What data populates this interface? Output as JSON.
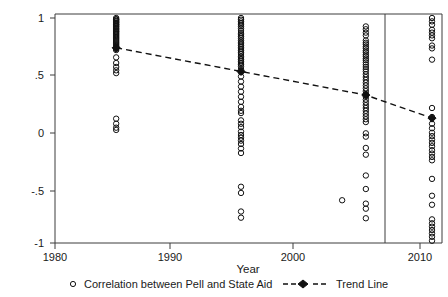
{
  "chart_data": {
    "type": "scatter",
    "title": "",
    "xlabel": "Year",
    "ylabel": "",
    "xlim": [
      1980,
      2011
    ],
    "ylim": [
      -1,
      1
    ],
    "grid": false,
    "legend_position": "bottom",
    "x_ticks": [
      1980,
      1990,
      2000,
      2010
    ],
    "x_tick_labels": [
      "1980",
      "1990",
      "2000",
      "2010"
    ],
    "y_ticks": [
      1,
      0.5,
      0,
      -0.5,
      -1
    ],
    "y_tick_labels": [
      "1",
      ".5",
      "0",
      "-.5",
      "-1"
    ],
    "annotations": [
      {
        "name": "reference-vline",
        "type": "vline",
        "x": 2008.4,
        "label": ""
      }
    ],
    "series": [
      {
        "name": "Correlation between Pell and State Aid",
        "marker": "open-circle",
        "color": "#111111",
        "points": [
          {
            "x": 1984.9,
            "y": 1.0
          },
          {
            "x": 1984.9,
            "y": 0.99
          },
          {
            "x": 1984.9,
            "y": 0.985
          },
          {
            "x": 1984.9,
            "y": 0.975
          },
          {
            "x": 1984.9,
            "y": 0.97
          },
          {
            "x": 1984.9,
            "y": 0.96
          },
          {
            "x": 1984.9,
            "y": 0.955
          },
          {
            "x": 1984.9,
            "y": 0.945
          },
          {
            "x": 1984.9,
            "y": 0.94
          },
          {
            "x": 1984.9,
            "y": 0.93
          },
          {
            "x": 1984.9,
            "y": 0.925
          },
          {
            "x": 1984.9,
            "y": 0.915
          },
          {
            "x": 1984.9,
            "y": 0.905
          },
          {
            "x": 1984.9,
            "y": 0.9
          },
          {
            "x": 1984.9,
            "y": 0.89
          },
          {
            "x": 1984.9,
            "y": 0.88
          },
          {
            "x": 1984.9,
            "y": 0.875
          },
          {
            "x": 1984.9,
            "y": 0.865
          },
          {
            "x": 1984.9,
            "y": 0.855
          },
          {
            "x": 1984.9,
            "y": 0.845
          },
          {
            "x": 1984.9,
            "y": 0.835
          },
          {
            "x": 1984.9,
            "y": 0.825
          },
          {
            "x": 1984.9,
            "y": 0.815
          },
          {
            "x": 1984.9,
            "y": 0.805
          },
          {
            "x": 1984.9,
            "y": 0.795
          },
          {
            "x": 1984.9,
            "y": 0.785
          },
          {
            "x": 1984.9,
            "y": 0.775
          },
          {
            "x": 1984.9,
            "y": 0.765
          },
          {
            "x": 1984.9,
            "y": 0.755
          },
          {
            "x": 1984.9,
            "y": 0.745
          },
          {
            "x": 1984.9,
            "y": 0.735
          },
          {
            "x": 1984.9,
            "y": 0.725
          },
          {
            "x": 1984.9,
            "y": 0.715
          },
          {
            "x": 1984.9,
            "y": 0.65
          },
          {
            "x": 1984.9,
            "y": 0.6
          },
          {
            "x": 1984.9,
            "y": 0.565
          },
          {
            "x": 1984.9,
            "y": 0.535
          },
          {
            "x": 1984.9,
            "y": 0.51
          },
          {
            "x": 1984.9,
            "y": 0.105
          },
          {
            "x": 1984.9,
            "y": 0.06
          },
          {
            "x": 1984.9,
            "y": 0.025
          },
          {
            "x": 1984.9,
            "y": 0.005
          },
          {
            "x": 1994.9,
            "y": 1.0
          },
          {
            "x": 1994.9,
            "y": 0.985
          },
          {
            "x": 1994.9,
            "y": 0.97
          },
          {
            "x": 1994.9,
            "y": 0.955
          },
          {
            "x": 1994.9,
            "y": 0.94
          },
          {
            "x": 1994.9,
            "y": 0.925
          },
          {
            "x": 1994.9,
            "y": 0.905
          },
          {
            "x": 1994.9,
            "y": 0.885
          },
          {
            "x": 1994.9,
            "y": 0.865
          },
          {
            "x": 1994.9,
            "y": 0.85
          },
          {
            "x": 1994.9,
            "y": 0.835
          },
          {
            "x": 1994.9,
            "y": 0.82
          },
          {
            "x": 1994.9,
            "y": 0.8
          },
          {
            "x": 1994.9,
            "y": 0.785
          },
          {
            "x": 1994.9,
            "y": 0.77
          },
          {
            "x": 1994.9,
            "y": 0.755
          },
          {
            "x": 1994.9,
            "y": 0.74
          },
          {
            "x": 1994.9,
            "y": 0.725
          },
          {
            "x": 1994.9,
            "y": 0.71
          },
          {
            "x": 1994.9,
            "y": 0.695
          },
          {
            "x": 1994.9,
            "y": 0.68
          },
          {
            "x": 1994.9,
            "y": 0.66
          },
          {
            "x": 1994.9,
            "y": 0.645
          },
          {
            "x": 1994.9,
            "y": 0.63
          },
          {
            "x": 1994.9,
            "y": 0.615
          },
          {
            "x": 1994.9,
            "y": 0.6
          },
          {
            "x": 1994.9,
            "y": 0.585
          },
          {
            "x": 1994.9,
            "y": 0.57
          },
          {
            "x": 1994.9,
            "y": 0.545
          },
          {
            "x": 1994.9,
            "y": 0.52
          },
          {
            "x": 1994.9,
            "y": 0.48
          },
          {
            "x": 1994.9,
            "y": 0.435
          },
          {
            "x": 1994.9,
            "y": 0.39
          },
          {
            "x": 1994.9,
            "y": 0.345
          },
          {
            "x": 1994.9,
            "y": 0.3
          },
          {
            "x": 1994.9,
            "y": 0.255
          },
          {
            "x": 1994.9,
            "y": 0.21
          },
          {
            "x": 1994.9,
            "y": 0.175
          },
          {
            "x": 1994.9,
            "y": 0.155
          },
          {
            "x": 1994.9,
            "y": 0.09
          },
          {
            "x": 1994.9,
            "y": 0.06
          },
          {
            "x": 1994.9,
            "y": 0.03
          },
          {
            "x": 1994.9,
            "y": -0.01
          },
          {
            "x": 1994.9,
            "y": -0.04
          },
          {
            "x": 1994.9,
            "y": -0.065
          },
          {
            "x": 1994.9,
            "y": -0.09
          },
          {
            "x": 1994.9,
            "y": -0.12
          },
          {
            "x": 1994.9,
            "y": -0.16
          },
          {
            "x": 1994.9,
            "y": -0.2
          },
          {
            "x": 1994.9,
            "y": -0.5
          },
          {
            "x": 1994.9,
            "y": -0.555
          },
          {
            "x": 1994.9,
            "y": -0.72
          },
          {
            "x": 1994.9,
            "y": -0.775
          },
          {
            "x": 2004.9,
            "y": 0.925
          },
          {
            "x": 2004.9,
            "y": 0.9
          },
          {
            "x": 2004.9,
            "y": 0.87
          },
          {
            "x": 2004.9,
            "y": 0.845
          },
          {
            "x": 2004.9,
            "y": 0.8
          },
          {
            "x": 2004.9,
            "y": 0.78
          },
          {
            "x": 2004.9,
            "y": 0.765
          },
          {
            "x": 2004.9,
            "y": 0.745
          },
          {
            "x": 2004.9,
            "y": 0.73
          },
          {
            "x": 2004.9,
            "y": 0.71
          },
          {
            "x": 2004.9,
            "y": 0.695
          },
          {
            "x": 2004.9,
            "y": 0.675
          },
          {
            "x": 2004.9,
            "y": 0.66
          },
          {
            "x": 2004.9,
            "y": 0.64
          },
          {
            "x": 2004.9,
            "y": 0.625
          },
          {
            "x": 2004.9,
            "y": 0.605
          },
          {
            "x": 2004.9,
            "y": 0.585
          },
          {
            "x": 2004.9,
            "y": 0.565
          },
          {
            "x": 2004.9,
            "y": 0.545
          },
          {
            "x": 2004.9,
            "y": 0.525
          },
          {
            "x": 2004.9,
            "y": 0.5
          },
          {
            "x": 2004.9,
            "y": 0.475
          },
          {
            "x": 2004.9,
            "y": 0.45
          },
          {
            "x": 2004.9,
            "y": 0.425
          },
          {
            "x": 2004.9,
            "y": 0.4
          },
          {
            "x": 2004.9,
            "y": 0.375
          },
          {
            "x": 2004.9,
            "y": 0.35
          },
          {
            "x": 2004.9,
            "y": 0.325
          },
          {
            "x": 2004.9,
            "y": 0.3
          },
          {
            "x": 2004.9,
            "y": 0.275
          },
          {
            "x": 2004.9,
            "y": 0.25
          },
          {
            "x": 2004.9,
            "y": 0.225
          },
          {
            "x": 2004.9,
            "y": 0.2
          },
          {
            "x": 2004.9,
            "y": 0.175
          },
          {
            "x": 2004.9,
            "y": 0.15
          },
          {
            "x": 2004.9,
            "y": 0.125
          },
          {
            "x": 2004.9,
            "y": 0.1
          },
          {
            "x": 2004.9,
            "y": 0.075
          },
          {
            "x": 2004.9,
            "y": -0.025
          },
          {
            "x": 2004.9,
            "y": -0.055
          },
          {
            "x": 2004.9,
            "y": -0.155
          },
          {
            "x": 2004.9,
            "y": -0.215
          },
          {
            "x": 2004.9,
            "y": -0.4
          },
          {
            "x": 2004.9,
            "y": -0.52
          },
          {
            "x": 2004.9,
            "y": -0.65
          },
          {
            "x": 2004.9,
            "y": -0.695
          },
          {
            "x": 2004.9,
            "y": -0.78
          },
          {
            "x": 2010.2,
            "y": 1.0
          },
          {
            "x": 2010.2,
            "y": 0.97
          },
          {
            "x": 2010.2,
            "y": 0.94
          },
          {
            "x": 2010.2,
            "y": 0.895
          },
          {
            "x": 2010.2,
            "y": 0.87
          },
          {
            "x": 2010.2,
            "y": 0.845
          },
          {
            "x": 2010.2,
            "y": 0.82
          },
          {
            "x": 2010.2,
            "y": 0.755
          },
          {
            "x": 2010.2,
            "y": 0.73
          },
          {
            "x": 2010.2,
            "y": 0.63
          },
          {
            "x": 2010.2,
            "y": 0.2
          },
          {
            "x": 2010.2,
            "y": 0.12
          },
          {
            "x": 2010.2,
            "y": 0.06
          },
          {
            "x": 2010.2,
            "y": 0.02
          },
          {
            "x": 2010.2,
            "y": -0.02
          },
          {
            "x": 2010.2,
            "y": -0.05
          },
          {
            "x": 2010.2,
            "y": -0.08
          },
          {
            "x": 2010.2,
            "y": -0.11
          },
          {
            "x": 2010.2,
            "y": -0.14
          },
          {
            "x": 2010.2,
            "y": -0.175
          },
          {
            "x": 2010.2,
            "y": -0.205
          },
          {
            "x": 2010.2,
            "y": -0.235
          },
          {
            "x": 2010.2,
            "y": -0.265
          },
          {
            "x": 2010.2,
            "y": -0.43
          },
          {
            "x": 2010.2,
            "y": -0.58
          },
          {
            "x": 2010.2,
            "y": -0.66
          },
          {
            "x": 2010.2,
            "y": -0.79
          },
          {
            "x": 2010.2,
            "y": -0.825
          },
          {
            "x": 2010.2,
            "y": -0.855
          },
          {
            "x": 2010.2,
            "y": -0.885
          },
          {
            "x": 2010.2,
            "y": -0.915
          },
          {
            "x": 2010.2,
            "y": -0.945
          },
          {
            "x": 2010.2,
            "y": -0.98
          },
          {
            "x": 2003.0,
            "y": -0.62
          }
        ]
      },
      {
        "name": "Trend Line",
        "marker": "filled-diamond",
        "linestyle": "dashed",
        "color": "#111111",
        "points": [
          {
            "x": 1984.9,
            "y": 0.735
          },
          {
            "x": 1994.9,
            "y": 0.525
          },
          {
            "x": 2004.9,
            "y": 0.315
          },
          {
            "x": 2010.2,
            "y": 0.11
          }
        ]
      }
    ]
  },
  "legend": {
    "entries": [
      {
        "label": "Correlation between Pell and State Aid",
        "marker": "open-circle"
      },
      {
        "label": "Trend Line",
        "marker": "dashed-diamond"
      }
    ]
  },
  "axes": {
    "x_title": "Year",
    "x_tick_labels": [
      "1980",
      "1990",
      "2000",
      "2010"
    ],
    "y_tick_labels": [
      "1",
      ".5",
      "0",
      "-.5",
      "-1"
    ]
  }
}
